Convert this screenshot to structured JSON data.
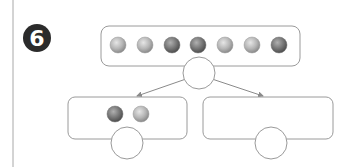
{
  "exercise": {
    "number": "6",
    "badge_color": "#2b2b2b"
  },
  "diagram": {
    "type": "part-whole number bond",
    "whole": {
      "ball_count": 7,
      "answer_circle": ""
    },
    "parts": [
      {
        "name": "left",
        "ball_count": 2,
        "answer_circle": ""
      },
      {
        "name": "right",
        "ball_count": 0,
        "answer_circle": ""
      }
    ],
    "colors": {
      "stroke": "#9a9a9a",
      "ball_light": "#c8c8c8",
      "ball_dark": "#6e6e6e",
      "margin_line": "#a0a0a0"
    }
  }
}
